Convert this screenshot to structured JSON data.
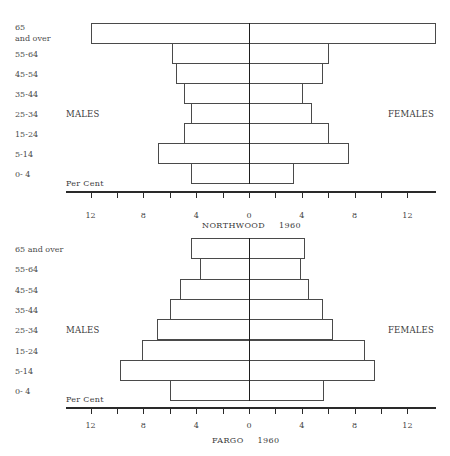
{
  "chart_data": [
    {
      "type": "bar",
      "subtype": "population-pyramid",
      "title": "NORTHWOOD",
      "year": "1960",
      "xlabel": "Per Cent",
      "left_label": "MALES",
      "right_label": "FEMALES",
      "categories": [
        "65\nand over",
        "55-64",
        "45-54",
        "35-44",
        "25-34",
        "15-24",
        "5-14",
        "0- 4"
      ],
      "series": [
        {
          "name": "MALES",
          "values": [
            12.0,
            5.8,
            5.5,
            4.9,
            4.4,
            4.9,
            6.9,
            4.4
          ]
        },
        {
          "name": "FEMALES",
          "values": [
            14.1,
            6.0,
            5.5,
            4.0,
            4.7,
            6.0,
            7.5,
            3.3
          ]
        }
      ],
      "ticks": [
        12,
        8,
        4,
        0,
        4,
        8,
        12
      ],
      "xlim": [
        -14,
        14
      ]
    },
    {
      "type": "bar",
      "subtype": "population-pyramid",
      "title": "FARGO",
      "year": "1960",
      "xlabel": "Per Cent",
      "left_label": "MALES",
      "right_label": "FEMALES",
      "categories": [
        "65 and over",
        "55-64",
        "45-54",
        "35-44",
        "25-34",
        "15-24",
        "5-14",
        "0- 4"
      ],
      "series": [
        {
          "name": "MALES",
          "values": [
            4.4,
            3.7,
            5.2,
            6.0,
            7.0,
            8.1,
            9.8,
            6.0
          ]
        },
        {
          "name": "FEMALES",
          "values": [
            4.2,
            3.9,
            4.5,
            5.5,
            6.3,
            8.7,
            9.5,
            5.6
          ]
        }
      ],
      "ticks": [
        12,
        8,
        4,
        0,
        4,
        8,
        12
      ],
      "xlim": [
        -14,
        14
      ]
    }
  ]
}
